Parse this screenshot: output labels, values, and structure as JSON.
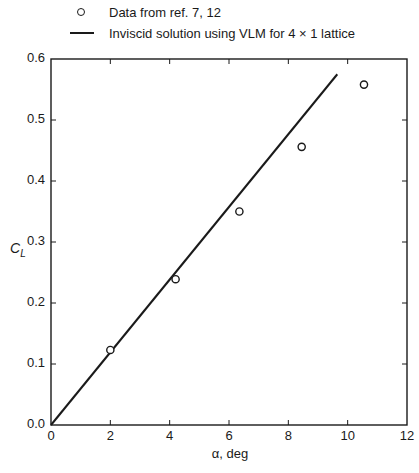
{
  "legend": {
    "items": [
      {
        "marker": "open-circle",
        "label": "Data from ref. 7, 12"
      },
      {
        "marker": "solid-line",
        "label": "Inviscid solution using VLM for 4 × 1 lattice"
      }
    ]
  },
  "axes": {
    "xlabel": "α, deg",
    "ylabel_main": "C",
    "ylabel_sub": "L",
    "x_ticks": [
      "0",
      "2",
      "4",
      "6",
      "8",
      "10",
      "12"
    ],
    "y_ticks": [
      "0.0",
      "0.1",
      "0.2",
      "0.3",
      "0.4",
      "0.5",
      "0.6"
    ]
  },
  "colors": {
    "ink": "#1a1a1a",
    "background": "#ffffff"
  },
  "chart_data": {
    "type": "scatter",
    "title": "",
    "xlabel": "α, deg",
    "ylabel": "C_L",
    "xlim": [
      0,
      12
    ],
    "ylim": [
      0.0,
      0.6
    ],
    "x_ticks": [
      0,
      2,
      4,
      6,
      8,
      10,
      12
    ],
    "y_ticks": [
      0.0,
      0.1,
      0.2,
      0.3,
      0.4,
      0.5,
      0.6
    ],
    "grid": false,
    "legend_position": "top, above plot",
    "series": [
      {
        "name": "Data from ref. 7, 12",
        "type": "scatter",
        "marker": "open-circle",
        "x": [
          2.0,
          4.2,
          6.35,
          8.45,
          10.55
        ],
        "y": [
          0.123,
          0.239,
          0.35,
          0.456,
          0.558
        ]
      },
      {
        "name": "Inviscid solution using VLM for 4 × 1 lattice",
        "type": "line",
        "x": [
          0,
          9.65
        ],
        "y": [
          0.0,
          0.575
        ]
      }
    ]
  }
}
